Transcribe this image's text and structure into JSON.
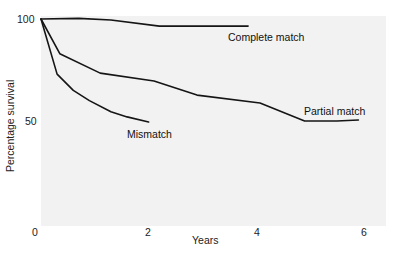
{
  "chart_data": {
    "type": "line",
    "title": "",
    "xlabel": "Years",
    "ylabel": "Percentage survival",
    "xlim": [
      0,
      6
    ],
    "ylim": [
      0,
      100
    ],
    "x_ticks": [
      "0",
      "2",
      "4",
      "6"
    ],
    "y_ticks": [
      "100",
      "50"
    ],
    "grid": false,
    "legend": "inline labels next to curves",
    "series": [
      {
        "name": "Complete match",
        "points": [
          [
            0,
            100
          ],
          [
            0.7,
            100.3
          ],
          [
            1.3,
            99.5
          ],
          [
            2.2,
            96.5
          ],
          [
            3.85,
            96.5
          ]
        ]
      },
      {
        "name": "Partial match",
        "points": [
          [
            0,
            100
          ],
          [
            0.35,
            83
          ],
          [
            1.1,
            73.5
          ],
          [
            2.1,
            69.6
          ],
          [
            2.9,
            62.7
          ],
          [
            4.07,
            58.8
          ],
          [
            4.9,
            50
          ],
          [
            5.5,
            50
          ],
          [
            5.9,
            50.5
          ]
        ]
      },
      {
        "name": "Mismatch",
        "points": [
          [
            0,
            100
          ],
          [
            0.3,
            73
          ],
          [
            0.6,
            65
          ],
          [
            0.9,
            60
          ],
          [
            1.3,
            54.5
          ],
          [
            1.6,
            52
          ],
          [
            2.0,
            49.5
          ]
        ]
      }
    ],
    "annotations": [
      "Complete match",
      "Partial match",
      "Mismatch"
    ]
  },
  "labels": {
    "complete": "Complete match",
    "partial": "Partial match",
    "mismatch": "Mismatch",
    "xlabel": "Years",
    "ylabel": "Percentage survival",
    "xticks": [
      "0",
      "2",
      "4",
      "6"
    ],
    "yticks": [
      "100",
      "50"
    ]
  },
  "colors": {
    "line": "#151515",
    "plot_background": "#f2f2f2"
  }
}
